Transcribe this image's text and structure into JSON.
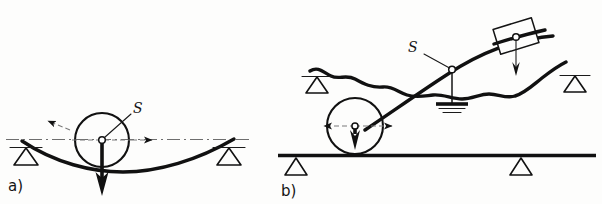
{
  "figure": {
    "background_color": "#fdfdfc",
    "ink_color": "#111111",
    "panels": [
      {
        "id": "a",
        "label": "a)",
        "description": "Simply supported flexible beam sagging under a wheel load at midspan",
        "elements": {
          "centroid_label": "S",
          "wheel": {
            "kind": "circle",
            "center_marker": "open-dot"
          },
          "load_arrow": {
            "direction": "down",
            "style": "solid-heavy"
          },
          "motion_arrows": [
            {
              "direction": "up-left",
              "style": "dashed-with-solid-head"
            },
            {
              "direction": "right",
              "style": "dashed-with-solid-head"
            }
          ],
          "axis_line": {
            "style": "dash-dot",
            "color": "#6e6e6e"
          },
          "supports": [
            {
              "position": "left",
              "kind": "triangle-knife-edge"
            },
            {
              "position": "right",
              "kind": "triangle-knife-edge"
            }
          ],
          "beam": {
            "kind": "sagging-curve",
            "style": "heavy"
          }
        }
      },
      {
        "id": "b",
        "label": "b)",
        "description": "Wheel on a straight rail driving an inclined link attached to a wavy member with a fixed ground pivot and a sliding block",
        "elements": {
          "centroid_label": "S",
          "wheel": {
            "kind": "circle",
            "center_marker": "open-dot"
          },
          "load_arrow": {
            "direction": "down",
            "style": "solid-heavy-short"
          },
          "motion_arrows": [
            {
              "direction": "left",
              "style": "dashed-with-solid-head"
            },
            {
              "direction": "right",
              "style": "dashed-with-solid-head"
            }
          ],
          "pivot": {
            "kind": "open-dot",
            "support": "vertical-rod-to-ground-symbol"
          },
          "ground_symbol": {
            "kind": "stacked-horizontal-bars",
            "bars": 3
          },
          "block": {
            "kind": "tilted-rectangle",
            "center_marker": "open-dot",
            "load_arrow": "down"
          },
          "wavy_member": {
            "kind": "freehand-wave",
            "style": "heavy"
          },
          "wavy_supports": [
            {
              "position": "left",
              "kind": "triangle-knife-edge"
            },
            {
              "position": "right",
              "kind": "triangle-knife-edge"
            }
          ],
          "rail": {
            "kind": "straight-heavy-line"
          },
          "rail_supports": [
            {
              "position": "left",
              "kind": "triangle-knife-edge"
            },
            {
              "position": "right",
              "kind": "triangle-knife-edge"
            }
          ]
        }
      }
    ]
  }
}
